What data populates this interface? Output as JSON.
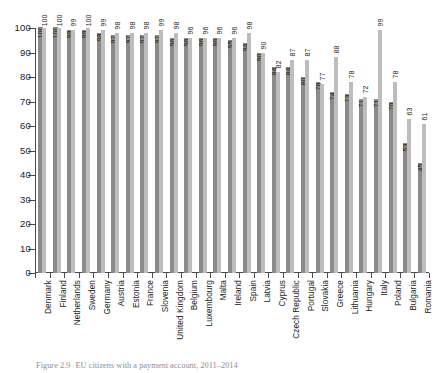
{
  "figure": {
    "caption_number": "Figure 2.9",
    "caption_text": "EU citizens with a payment account, 2011–2014"
  },
  "chart_data": {
    "type": "bar",
    "title": "EU citizens with a payment account, 2011–2014",
    "xlabel": "",
    "ylabel": "",
    "ylim": [
      0,
      100
    ],
    "yticks": [
      0,
      10,
      20,
      30,
      40,
      50,
      60,
      70,
      80,
      90,
      100
    ],
    "ytick_labels": [
      "0",
      "10",
      "20",
      "30",
      "40",
      "50",
      "60",
      "70",
      "80",
      "90",
      "100"
    ],
    "grid": false,
    "legend_position": "none",
    "categories": [
      "Denmark",
      "Finland",
      "Netherlands",
      "Sweden",
      "Germany",
      "Austria",
      "Estonia",
      "France",
      "Slovenia",
      "United Kingdom",
      "Belgium",
      "Luxembourg",
      "Malta",
      "Ireland",
      "Spain",
      "Latvia",
      "Cyprus",
      "Czech Republic",
      "Portugal",
      "Slovakia",
      "Greece",
      "Lithuania",
      "Hungary",
      "Italy",
      "Poland",
      "Bulgaria",
      "Romania"
    ],
    "series": [
      {
        "name": "2011",
        "color": "#8a8a8a",
        "values": [
          100,
          100,
          99,
          99,
          98,
          97,
          97,
          97,
          97,
          96,
          96,
          96,
          96,
          95,
          94,
          90,
          84,
          84,
          80,
          78,
          74,
          73,
          71,
          71,
          70,
          53,
          45
        ]
      },
      {
        "name": "2014",
        "color": "#bdbdbd",
        "values": [
          100,
          100,
          99,
          100,
          99,
          98,
          98,
          98,
          99,
          98,
          96,
          96,
          96,
          96,
          98,
          90,
          82,
          87,
          87,
          77,
          88,
          78,
          72,
          99,
          78,
          63,
          61
        ]
      }
    ]
  }
}
